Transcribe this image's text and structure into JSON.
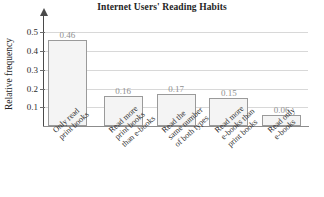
{
  "chart_data": {
    "type": "bar",
    "title": "Internet Users' Reading Habits",
    "xlabel": "",
    "ylabel": "Relative frequency",
    "categories": [
      "Only read print books",
      "Read more print books than e-books",
      "Read the same number of both types",
      "Read more e-books than print books",
      "Read only e-books"
    ],
    "category_lines": [
      [
        "Only read",
        "print books"
      ],
      [
        "Read more",
        "print books",
        "than e-books"
      ],
      [
        "Read the",
        "same number",
        "of both types"
      ],
      [
        "Read more",
        "e-books than",
        "print books"
      ],
      [
        "Read only",
        "e-books"
      ]
    ],
    "values": [
      0.46,
      0.16,
      0.17,
      0.15,
      0.06
    ],
    "value_labels": [
      "0.46",
      "0.16",
      "0.17",
      "0.15",
      "0.06"
    ],
    "ylim": [
      0,
      0.54
    ],
    "yticks": [
      0.1,
      0.2,
      0.3,
      0.4,
      0.5
    ],
    "ytick_labels": [
      "0.1",
      "0.2",
      "0.3",
      "0.4",
      "0.5"
    ],
    "grid": true,
    "legend": null,
    "colors": {
      "bar_fill": "#f4f4f4",
      "bar_border": "#9a9a9a",
      "gridline": "#d8d8d8",
      "axis": "#4a4a4a",
      "value_label": "#8f8f8f",
      "text": "#242424"
    }
  }
}
